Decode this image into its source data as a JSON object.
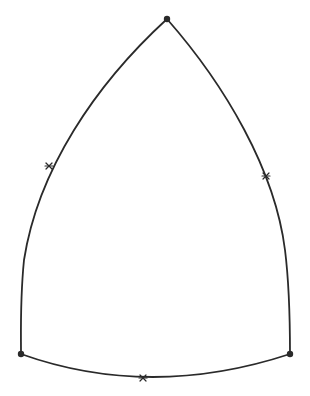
{
  "diagram": {
    "type": "curved-triangle",
    "stroke_color": "#2a2a2a",
    "background": "#ffffff",
    "vertices": [
      {
        "name": "top",
        "x": 167,
        "y": 19
      },
      {
        "name": "bottom-left",
        "x": 21,
        "y": 354
      },
      {
        "name": "bottom-right",
        "x": 290,
        "y": 354
      }
    ],
    "midpoints": [
      {
        "name": "left-side-midpoint",
        "x": 49,
        "y": 167
      },
      {
        "name": "right-side-midpoint",
        "x": 266,
        "y": 176
      },
      {
        "name": "bottom-side-midpoint",
        "x": 143,
        "y": 378
      }
    ]
  }
}
